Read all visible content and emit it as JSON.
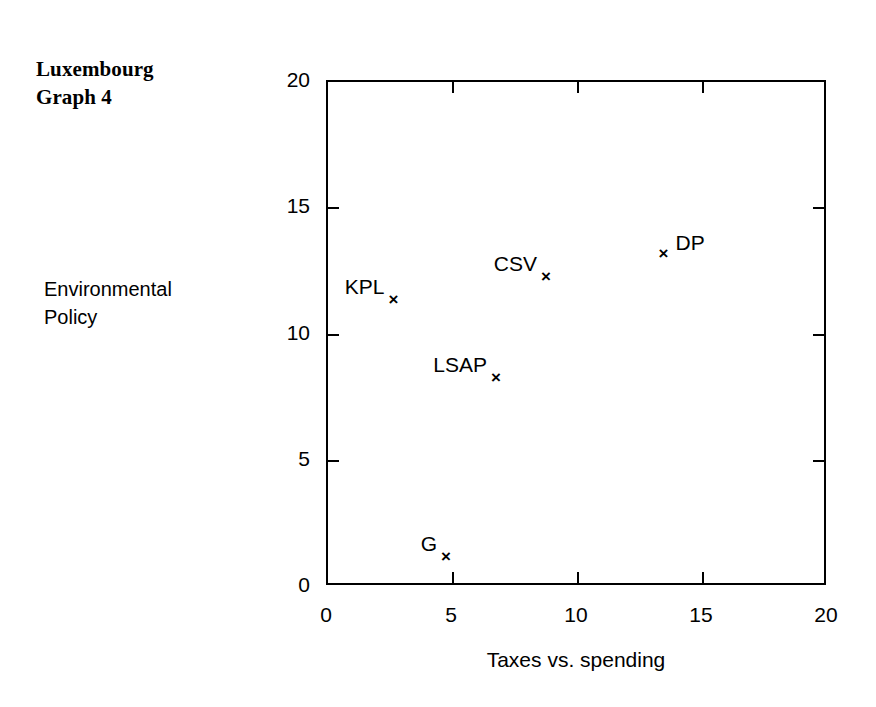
{
  "title": {
    "line1": "Luxembourg",
    "line2": "Graph 4"
  },
  "axes": {
    "y_title_line1": "Environmental",
    "y_title_line2": "Policy",
    "x_title": "Taxes vs. spending",
    "x_ticks": [
      "0",
      "5",
      "10",
      "15",
      "20"
    ],
    "y_ticks": [
      "0",
      "5",
      "10",
      "15",
      "20"
    ]
  },
  "marker_glyph": "×",
  "points": [
    {
      "label": "KPL",
      "x": 2.7,
      "y": 11.3,
      "label_side": "left"
    },
    {
      "label": "CSV",
      "x": 8.8,
      "y": 12.2,
      "label_side": "left"
    },
    {
      "label": "LSAP",
      "x": 6.8,
      "y": 8.2,
      "label_side": "left"
    },
    {
      "label": "DP",
      "x": 13.5,
      "y": 13.1,
      "label_side": "right"
    },
    {
      "label": "G",
      "x": 4.8,
      "y": 1.1,
      "label_side": "left"
    }
  ],
  "chart_data": {
    "type": "scatter",
    "title": "Luxembourg Graph 4",
    "xlabel": "Taxes vs. spending",
    "ylabel": "Environmental Policy",
    "xlim": [
      0,
      20
    ],
    "ylim": [
      0,
      20
    ],
    "xticks": [
      0,
      5,
      10,
      15,
      20
    ],
    "yticks": [
      0,
      5,
      10,
      15,
      20
    ],
    "grid": false,
    "legend": "none",
    "marker": "x",
    "color": "#000000",
    "points": [
      {
        "name": "KPL",
        "x": 2.7,
        "y": 11.3
      },
      {
        "name": "CSV",
        "x": 8.8,
        "y": 12.2
      },
      {
        "name": "LSAP",
        "x": 6.8,
        "y": 8.2
      },
      {
        "name": "DP",
        "x": 13.5,
        "y": 13.1
      },
      {
        "name": "G",
        "x": 4.8,
        "y": 1.1
      }
    ]
  }
}
